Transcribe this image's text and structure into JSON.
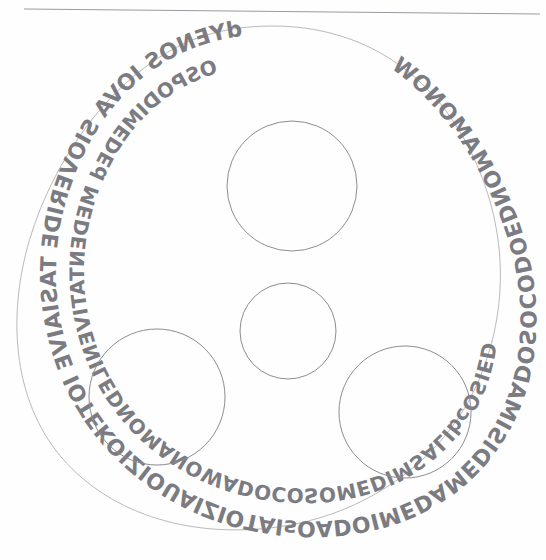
{
  "page": {
    "medium": "pencil on white paper",
    "background_color": "#fefefe",
    "ink_color": "#8d8d93",
    "text_color": "#7b7b82",
    "width": 546,
    "height": 560
  },
  "top_rule": {
    "name": "horizontal-rule",
    "description": "faint ruled pencil line across the top of the sheet",
    "x1": 24,
    "y1": 9,
    "x2": 540,
    "y2": 14,
    "color": "#9a9aa0"
  },
  "outline": {
    "name": "rounded-triangle-band",
    "description": "large rounded equilateral-triangle (Reuleaux-like) outline enclosing the lettering band",
    "stroke": "#b9b9bf"
  },
  "circles": [
    {
      "name": "circle-top",
      "label": "top circle",
      "cx": 292,
      "cy": 186,
      "r": 65
    },
    {
      "name": "circle-center-small",
      "label": "center small circle",
      "cx": 288,
      "cy": 331,
      "r": 48
    },
    {
      "name": "circle-bottom-left",
      "label": "bottom-left circle",
      "cx": 157,
      "cy": 397,
      "r": 68
    },
    {
      "name": "circle-bottom-right",
      "label": "bottom-right circle",
      "cx": 405,
      "cy": 412,
      "r": 66
    }
  ],
  "lettering": {
    "note": "All handwriting is mirror-writing (reversed) hand-printed capitals arranged in two concentric rings that follow the rounded-triangle band.",
    "outer_ring_text": "dYENOS IOVA SIOVERIDE TASIAIVE IOTEKOIZIOUAIZIOTAIsOADOIMEDAMEDISIMADOSOCODOEDNOMAMONOW",
    "inner_ring_text": "OSPODIMEDEd MEDENTATIVENILEDNOMANOWADOCOSOMEDIMSALIbcOSIED",
    "outer_segments": [
      {
        "name": "segment-top",
        "text": "dYENOS"
      },
      {
        "name": "segment-top-right",
        "text": "IOVA SIOV"
      },
      {
        "name": "segment-right",
        "text": "E TASIAIVE"
      },
      {
        "name": "segment-right-lower",
        "text": "IOTEKOIZIO"
      },
      {
        "name": "segment-bottom-right",
        "text": "UAIZIOTAIsOAD"
      },
      {
        "name": "segment-bottom",
        "text": "OIMEDAMEDISIM"
      },
      {
        "name": "segment-bottom-left",
        "text": "ADOSOCODO"
      },
      {
        "name": "segment-left",
        "text": "EDNOMAMONOW"
      }
    ],
    "inner_segments": [
      {
        "name": "inner-segment-top",
        "text": "OSPODIMEDEd"
      },
      {
        "name": "inner-segment-upper-left",
        "text": "MEDENTATIVE"
      },
      {
        "name": "inner-segment-left",
        "text": "NILEDNOMANOW"
      },
      {
        "name": "inner-segment-lower-left",
        "text": "ADOCOSOMEDIM"
      },
      {
        "name": "inner-segment-bottom",
        "text": "SALIbcOSIED"
      }
    ]
  }
}
